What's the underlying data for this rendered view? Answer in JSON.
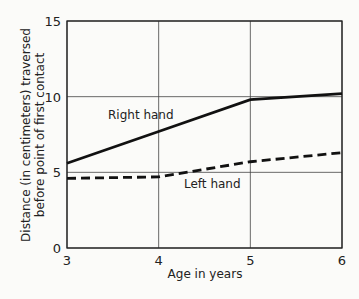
{
  "chart_data": {
    "type": "line",
    "title": "",
    "xlabel": "Age in years",
    "ylabel_line1": "Distance (in centimeters) traversed",
    "ylabel_line2": "before point of first contact",
    "x": [
      3,
      4,
      5,
      6
    ],
    "x_ticks": [
      "3",
      "4",
      "5",
      "6"
    ],
    "y_ticks": [
      "0",
      "5",
      "10",
      "15"
    ],
    "xlim": [
      3,
      6
    ],
    "ylim": [
      0,
      15
    ],
    "grid": true,
    "series": [
      {
        "name": "Right hand",
        "style": "solid",
        "values": [
          5.6,
          7.7,
          9.8,
          10.2
        ]
      },
      {
        "name": "Left hand",
        "style": "dashed",
        "values": [
          4.6,
          4.7,
          5.7,
          6.3
        ]
      }
    ],
    "annotations": [
      "Right hand",
      "Left hand"
    ]
  }
}
